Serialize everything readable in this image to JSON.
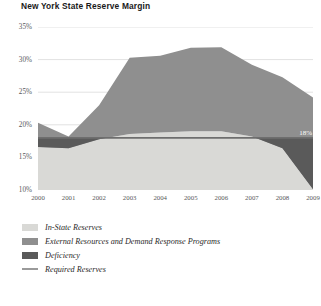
{
  "title": "New York State Reserve Margin",
  "source_note": "",
  "colors": {
    "in_state_reserves": "#d9d9d6",
    "external_resources": "#8f8f8f",
    "deficiency": "#5a5a5a",
    "required_reserves_line": "#6e6e6e",
    "grid": "#e2e2e2",
    "axis_text": "#58585a",
    "title_text": "#1a1a1a",
    "annotation_text": "#ffffff"
  },
  "annotations": [
    {
      "text": "18%",
      "x_year": 2008.55,
      "y_value": 18.0
    }
  ],
  "legend": {
    "position": "below",
    "items": [
      {
        "label": "In-State Reserves",
        "color": "#d9d9d6",
        "marker": "area"
      },
      {
        "label": "External Resources and Demand Response Programs",
        "color": "#8f8f8f",
        "marker": "area"
      },
      {
        "label": "Deficiency",
        "color": "#5a5a5a",
        "marker": "area"
      },
      {
        "label": "Required Reserves",
        "color": "#9a9a9a",
        "marker": "line"
      }
    ]
  },
  "chart_data": {
    "type": "area",
    "title": "New York State Reserve Margin",
    "xlabel": "",
    "ylabel": "",
    "stacked": true,
    "grid": true,
    "x": [
      2000,
      2001,
      2002,
      2003,
      2004,
      2005,
      2006,
      2007,
      2008,
      2009
    ],
    "categories": [
      "2000",
      "2001",
      "2002",
      "2003",
      "2004",
      "2005",
      "2006",
      "2007",
      "2008",
      "2009"
    ],
    "xlim": [
      2000,
      2009
    ],
    "ylim": [
      10,
      35
    ],
    "yticks": [
      10,
      15,
      20,
      25,
      30,
      35
    ],
    "ytick_labels": [
      "10%",
      "15%",
      "20%",
      "25%",
      "30%",
      "35%"
    ],
    "series": [
      {
        "name": "In-State Reserves",
        "color": "#d9d9d6",
        "type": "area",
        "note": "upper boundary of the bottom band, absolute % value",
        "values": [
          16.6,
          16.4,
          17.8,
          18.6,
          18.8,
          19.0,
          19.0,
          18.2,
          16.4,
          10.1
        ]
      },
      {
        "name": "External Resources and Demand Response Programs",
        "color": "#8f8f8f",
        "type": "area",
        "note": "upper boundary of the stack, absolute % value",
        "values": [
          20.3,
          18.2,
          23.0,
          30.3,
          30.6,
          31.8,
          31.9,
          29.2,
          27.3,
          24.2
        ]
      },
      {
        "name": "Deficiency",
        "color": "#5a5a5a",
        "type": "area",
        "note": "region between In-State Reserves and the 18% Required Reserves line where reserves fall short",
        "values": [
          1.4,
          1.6,
          0.2,
          0.0,
          0.0,
          0.0,
          0.0,
          0.0,
          1.6,
          7.9
        ]
      },
      {
        "name": "Required Reserves",
        "color": "#6e6e6e",
        "type": "line",
        "constant": 18.0,
        "values": [
          18.0,
          18.0,
          18.0,
          18.0,
          18.0,
          18.0,
          18.0,
          18.0,
          18.0,
          18.0
        ]
      }
    ]
  }
}
